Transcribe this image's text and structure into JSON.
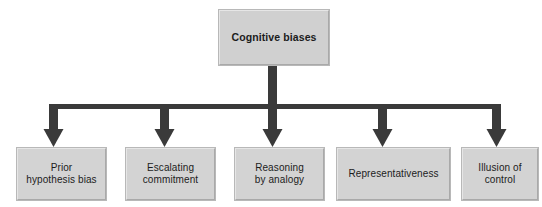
{
  "diagram": {
    "title": "Cognitive biases",
    "type": "hierarchy-tree",
    "orientation": "top-down",
    "colors": {
      "box_fill": "#d3d3d3",
      "box_border_light": "#e6e6e6",
      "box_border_dark": "#a9a9a9",
      "connector": "#3a3a3a",
      "text": "#1c1c1c",
      "background": "#ffffff"
    },
    "root": {
      "label": "Cognitive biases",
      "bold": true
    },
    "children": [
      {
        "label": "Prior\nhypothesis bias"
      },
      {
        "label": "Escalating\ncommitment"
      },
      {
        "label": "Reasoning\nby analogy"
      },
      {
        "label": "Representativeness"
      },
      {
        "label": "Illusion of\ncontrol"
      }
    ]
  }
}
